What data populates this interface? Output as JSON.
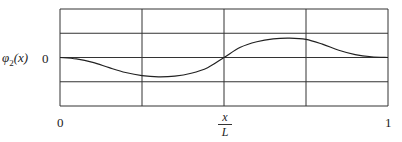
{
  "chart_data": {
    "type": "line",
    "title": "",
    "xlabel": "x / L",
    "ylabel": "φ2(x)",
    "xlim": [
      0,
      1
    ],
    "ylim": [
      -2,
      2
    ],
    "grid": true,
    "x_ticks": [
      "0",
      "1"
    ],
    "y_ticks": [
      "0"
    ],
    "grid_x": [
      0,
      0.25,
      0.5,
      0.75,
      1
    ],
    "grid_y": [
      -2,
      -1,
      0,
      1,
      2
    ],
    "series": [
      {
        "name": "φ2(x)",
        "x": [
          0,
          0.05,
          0.1,
          0.15,
          0.2,
          0.25,
          0.3,
          0.35,
          0.4,
          0.45,
          0.5,
          0.55,
          0.6,
          0.65,
          0.7,
          0.75,
          0.8,
          0.85,
          0.9,
          0.95,
          1
        ],
        "y": [
          0,
          -0.06,
          -0.2,
          -0.42,
          -0.62,
          -0.75,
          -0.8,
          -0.77,
          -0.65,
          -0.42,
          0,
          0.42,
          0.65,
          0.77,
          0.8,
          0.75,
          0.55,
          0.3,
          0.12,
          0.03,
          0
        ]
      }
    ],
    "legend": null
  },
  "labels": {
    "y_axis_label_main": "φ",
    "y_axis_label_sub": "2",
    "y_axis_label_arg": "(x)",
    "y_tick_zero": "0",
    "x_tick_start": "0",
    "x_tick_end": "1",
    "x_label_num": "x",
    "x_label_den": "L"
  }
}
